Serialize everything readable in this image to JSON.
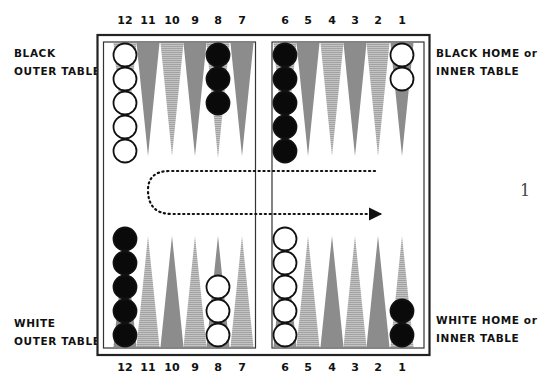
{
  "labels": {
    "black_outer": [
      "BLACK",
      "OUTER TABLE"
    ],
    "black_home": [
      "BLACK HOME or",
      "INNER TABLE"
    ],
    "white_outer": [
      "WHITE",
      "OUTER TABLE"
    ],
    "white_home": [
      "WHITE HOME or",
      "INNER TABLE"
    ]
  },
  "page_number": "1",
  "top_numbers": [
    {
      "label": "12",
      "x": 125
    },
    {
      "label": "11",
      "x": 148
    },
    {
      "label": "10",
      "x": 172
    },
    {
      "label": "9",
      "x": 195
    },
    {
      "label": "8",
      "x": 218
    },
    {
      "label": "7",
      "x": 242
    },
    {
      "label": "6",
      "x": 285
    },
    {
      "label": "5",
      "x": 308
    },
    {
      "label": "4",
      "x": 332
    },
    {
      "label": "3",
      "x": 355
    },
    {
      "label": "2",
      "x": 378
    },
    {
      "label": "1",
      "x": 402
    }
  ],
  "bottom_numbers": [
    {
      "label": "12",
      "x": 125
    },
    {
      "label": "11",
      "x": 148
    },
    {
      "label": "10",
      "x": 172
    },
    {
      "label": "9",
      "x": 195
    },
    {
      "label": "8",
      "x": 218
    },
    {
      "label": "7",
      "x": 242
    },
    {
      "label": "6",
      "x": 285
    },
    {
      "label": "5",
      "x": 308
    },
    {
      "label": "4",
      "x": 332
    },
    {
      "label": "3",
      "x": 355
    },
    {
      "label": "2",
      "x": 378
    },
    {
      "label": "1",
      "x": 402
    }
  ],
  "colors": {
    "frame": "#222222",
    "dark_point": "#8c8c8c",
    "light_point": "#b4b4b4",
    "black_checker": "#0a0a0a",
    "white_checker": "#ffffff"
  },
  "checkers": {
    "top": [
      {
        "point": "12",
        "color": "white",
        "count": 5
      },
      {
        "point": "8",
        "color": "black",
        "count": 3
      },
      {
        "point": "6",
        "color": "black",
        "count": 5
      },
      {
        "point": "1",
        "color": "white",
        "count": 2
      }
    ],
    "bottom": [
      {
        "point": "12",
        "color": "black",
        "count": 5
      },
      {
        "point": "8",
        "color": "white",
        "count": 3
      },
      {
        "point": "6",
        "color": "white",
        "count": 5
      },
      {
        "point": "1",
        "color": "black",
        "count": 2
      }
    ]
  },
  "movement_path": "dotted arrow from black home side, around the left, returning right toward white home"
}
